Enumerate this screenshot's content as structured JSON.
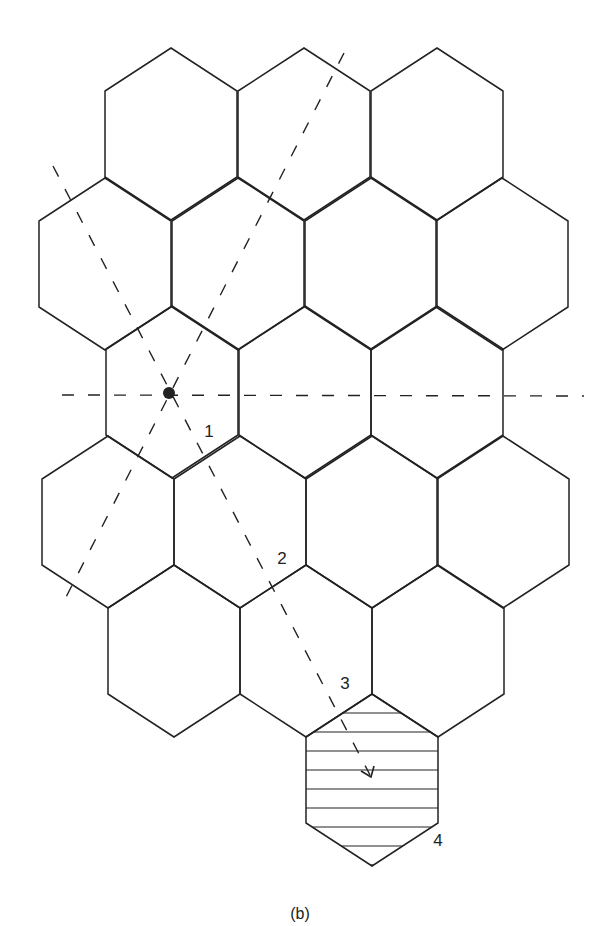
{
  "figure": {
    "caption": "(b)",
    "caption_pos": [
      300,
      914
    ],
    "stroke_color": "#222222",
    "background": "#ffffff"
  },
  "hex_geometry": {
    "half_width": 66,
    "slant": 43,
    "side": 86
  },
  "hexagons": [
    {
      "row": 0,
      "cx": 171,
      "top": 48
    },
    {
      "row": 0,
      "cx": 304,
      "top": 48
    },
    {
      "row": 0,
      "cx": 437,
      "top": 48
    },
    {
      "row": 1,
      "cx": 105,
      "top": 178
    },
    {
      "row": 1,
      "cx": 238,
      "top": 178
    },
    {
      "row": 1,
      "cx": 371,
      "top": 178
    },
    {
      "row": 1,
      "cx": 502,
      "top": 178
    },
    {
      "row": 2,
      "cx": 172,
      "top": 306
    },
    {
      "row": 2,
      "cx": 305,
      "top": 306
    },
    {
      "row": 2,
      "cx": 437,
      "top": 306
    },
    {
      "row": 3,
      "cx": 108,
      "top": 436
    },
    {
      "row": 3,
      "cx": 240,
      "top": 436
    },
    {
      "row": 3,
      "cx": 372,
      "top": 436
    },
    {
      "row": 3,
      "cx": 503,
      "top": 436
    },
    {
      "row": 4,
      "cx": 174,
      "top": 565
    },
    {
      "row": 4,
      "cx": 306,
      "top": 565
    },
    {
      "row": 4,
      "cx": 438,
      "top": 565
    },
    {
      "row": 5,
      "cx": 372,
      "top": 694,
      "hatched": true
    }
  ],
  "hatch_lines_y": [
    713,
    732,
    751,
    770,
    789,
    808,
    827,
    846,
    865
  ],
  "source_point": {
    "x": 169,
    "y": 393,
    "r": 6
  },
  "dashed_lines": [
    {
      "name": "horizontal-axis",
      "x1": 62,
      "y1": 395,
      "x2": 584,
      "y2": 396
    },
    {
      "name": "steep-diagonal",
      "x1": 344,
      "y1": 53,
      "x2": 62,
      "y2": 605
    },
    {
      "name": "descending-diagonal",
      "x1": 53,
      "y1": 166,
      "x2": 370,
      "y2": 775
    }
  ],
  "arrow": {
    "tip": [
      371,
      777
    ],
    "left": [
      361,
      771
    ],
    "right": [
      374,
      766
    ]
  },
  "labels": [
    {
      "text": "1",
      "x": 209,
      "y": 431
    },
    {
      "text": "2",
      "x": 282,
      "y": 558
    },
    {
      "text": "3",
      "x": 345,
      "y": 683
    },
    {
      "text": "4",
      "x": 438,
      "y": 840
    }
  ]
}
